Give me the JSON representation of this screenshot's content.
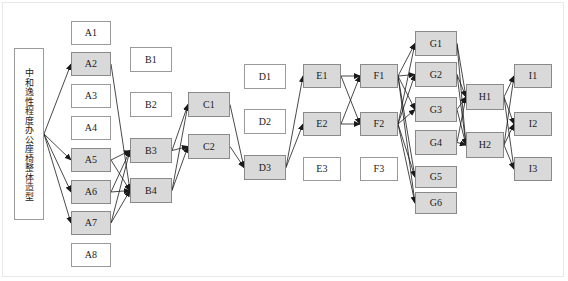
{
  "diagram": {
    "type": "layered-directed-graph",
    "root": {
      "id": "root",
      "label": "中和逸性程度办公座椅整体造型",
      "shaded": false,
      "x": 14,
      "y": 48,
      "w": 30,
      "h": 172
    },
    "colors": {
      "node_fill_plain": "#ffffff",
      "node_fill_shaded": "#d9d9d9",
      "node_stroke": "#9a9a9a",
      "edge_stroke": "#1a1a1a",
      "frame_stroke": "#e8e8e8",
      "text": "#1a1a1a"
    },
    "columns": [
      {
        "name": "A",
        "nodes": [
          {
            "id": "A1",
            "label": "A1",
            "shaded": false,
            "x": 71,
            "y": 21,
            "w": 40,
            "h": 24
          },
          {
            "id": "A2",
            "label": "A2",
            "shaded": true,
            "x": 71,
            "y": 52,
            "w": 40,
            "h": 24
          },
          {
            "id": "A3",
            "label": "A3",
            "shaded": false,
            "x": 71,
            "y": 84,
            "w": 40,
            "h": 24
          },
          {
            "id": "A4",
            "label": "A4",
            "shaded": false,
            "x": 71,
            "y": 116,
            "w": 40,
            "h": 24
          },
          {
            "id": "A5",
            "label": "A5",
            "shaded": true,
            "x": 71,
            "y": 148,
            "w": 40,
            "h": 24
          },
          {
            "id": "A6",
            "label": "A6",
            "shaded": true,
            "x": 71,
            "y": 180,
            "w": 40,
            "h": 24
          },
          {
            "id": "A7",
            "label": "A7",
            "shaded": true,
            "x": 71,
            "y": 211,
            "w": 40,
            "h": 24
          },
          {
            "id": "A8",
            "label": "A8",
            "shaded": false,
            "x": 71,
            "y": 243,
            "w": 40,
            "h": 24
          }
        ]
      },
      {
        "name": "B",
        "nodes": [
          {
            "id": "B1",
            "label": "B1",
            "shaded": false,
            "x": 130,
            "y": 47,
            "w": 42,
            "h": 25
          },
          {
            "id": "B2",
            "label": "B2",
            "shaded": false,
            "x": 130,
            "y": 92,
            "w": 42,
            "h": 25
          },
          {
            "id": "B3",
            "label": "B3",
            "shaded": true,
            "x": 130,
            "y": 138,
            "w": 42,
            "h": 25
          },
          {
            "id": "B4",
            "label": "B4",
            "shaded": true,
            "x": 130,
            "y": 178,
            "w": 42,
            "h": 25
          }
        ]
      },
      {
        "name": "C",
        "nodes": [
          {
            "id": "C1",
            "label": "C1",
            "shaded": true,
            "x": 188,
            "y": 92,
            "w": 42,
            "h": 25
          },
          {
            "id": "C2",
            "label": "C2",
            "shaded": true,
            "x": 188,
            "y": 134,
            "w": 42,
            "h": 25
          }
        ]
      },
      {
        "name": "D",
        "nodes": [
          {
            "id": "D1",
            "label": "D1",
            "shaded": false,
            "x": 244,
            "y": 64,
            "w": 42,
            "h": 25
          },
          {
            "id": "D2",
            "label": "D2",
            "shaded": false,
            "x": 244,
            "y": 109,
            "w": 42,
            "h": 25
          },
          {
            "id": "D3",
            "label": "D3",
            "shaded": true,
            "x": 244,
            "y": 155,
            "w": 42,
            "h": 25
          }
        ]
      },
      {
        "name": "E",
        "nodes": [
          {
            "id": "E1",
            "label": "E1",
            "shaded": true,
            "x": 303,
            "y": 64,
            "w": 38,
            "h": 24
          },
          {
            "id": "E2",
            "label": "E2",
            "shaded": true,
            "x": 303,
            "y": 112,
            "w": 38,
            "h": 24
          },
          {
            "id": "E3",
            "label": "E3",
            "shaded": false,
            "x": 303,
            "y": 157,
            "w": 38,
            "h": 24
          }
        ]
      },
      {
        "name": "F",
        "nodes": [
          {
            "id": "F1",
            "label": "F1",
            "shaded": true,
            "x": 360,
            "y": 64,
            "w": 38,
            "h": 24
          },
          {
            "id": "F2",
            "label": "F2",
            "shaded": true,
            "x": 360,
            "y": 112,
            "w": 38,
            "h": 24
          },
          {
            "id": "F3",
            "label": "F3",
            "shaded": false,
            "x": 360,
            "y": 157,
            "w": 38,
            "h": 24
          }
        ]
      },
      {
        "name": "G",
        "nodes": [
          {
            "id": "G1",
            "label": "G1",
            "shaded": true,
            "x": 415,
            "y": 31,
            "w": 42,
            "h": 25
          },
          {
            "id": "G2",
            "label": "G2",
            "shaded": true,
            "x": 415,
            "y": 62,
            "w": 42,
            "h": 25
          },
          {
            "id": "G3",
            "label": "G3",
            "shaded": true,
            "x": 415,
            "y": 97,
            "w": 42,
            "h": 25
          },
          {
            "id": "G4",
            "label": "G4",
            "shaded": true,
            "x": 415,
            "y": 130,
            "w": 42,
            "h": 25
          },
          {
            "id": "G5",
            "label": "G5",
            "shaded": true,
            "x": 415,
            "y": 166,
            "w": 42,
            "h": 22
          },
          {
            "id": "G6",
            "label": "G6",
            "shaded": true,
            "x": 415,
            "y": 192,
            "w": 42,
            "h": 22
          }
        ]
      },
      {
        "name": "H",
        "nodes": [
          {
            "id": "H1",
            "label": "H1",
            "shaded": true,
            "x": 466,
            "y": 84,
            "w": 38,
            "h": 26
          },
          {
            "id": "H2",
            "label": "H2",
            "shaded": true,
            "x": 466,
            "y": 132,
            "w": 38,
            "h": 26
          }
        ]
      },
      {
        "name": "I",
        "nodes": [
          {
            "id": "I1",
            "label": "I1",
            "shaded": true,
            "x": 514,
            "y": 64,
            "w": 38,
            "h": 24
          },
          {
            "id": "I2",
            "label": "I2",
            "shaded": true,
            "x": 514,
            "y": 112,
            "w": 38,
            "h": 24
          },
          {
            "id": "I3",
            "label": "I3",
            "shaded": true,
            "x": 514,
            "y": 157,
            "w": 38,
            "h": 24
          }
        ]
      }
    ],
    "edges": [
      {
        "from": "root",
        "to": "A2"
      },
      {
        "from": "root",
        "to": "A5"
      },
      {
        "from": "root",
        "to": "A6"
      },
      {
        "from": "root",
        "to": "A7"
      },
      {
        "from": "A2",
        "to": "B4"
      },
      {
        "from": "A5",
        "to": "B3"
      },
      {
        "from": "A5",
        "to": "B4"
      },
      {
        "from": "A6",
        "to": "B3"
      },
      {
        "from": "A6",
        "to": "B4"
      },
      {
        "from": "A7",
        "to": "B3"
      },
      {
        "from": "A7",
        "to": "B4"
      },
      {
        "from": "B3",
        "to": "C1"
      },
      {
        "from": "B3",
        "to": "C2"
      },
      {
        "from": "B4",
        "to": "C1"
      },
      {
        "from": "B4",
        "to": "C2"
      },
      {
        "from": "C1",
        "to": "D3"
      },
      {
        "from": "C2",
        "to": "D3"
      },
      {
        "from": "D3",
        "to": "E1"
      },
      {
        "from": "D3",
        "to": "E2"
      },
      {
        "from": "E1",
        "to": "F1"
      },
      {
        "from": "E1",
        "to": "F2"
      },
      {
        "from": "E2",
        "to": "F1"
      },
      {
        "from": "E2",
        "to": "F2"
      },
      {
        "from": "F1",
        "to": "G1"
      },
      {
        "from": "F1",
        "to": "G2"
      },
      {
        "from": "F1",
        "to": "G3"
      },
      {
        "from": "F1",
        "to": "G5"
      },
      {
        "from": "F1",
        "to": "G6"
      },
      {
        "from": "F2",
        "to": "G1"
      },
      {
        "from": "F2",
        "to": "G2"
      },
      {
        "from": "F2",
        "to": "G3"
      },
      {
        "from": "F2",
        "to": "G5"
      },
      {
        "from": "F2",
        "to": "G6"
      },
      {
        "from": "G1",
        "to": "H1"
      },
      {
        "from": "G1",
        "to": "H2"
      },
      {
        "from": "G2",
        "to": "H1"
      },
      {
        "from": "G2",
        "to": "H2"
      },
      {
        "from": "G3",
        "to": "H1"
      },
      {
        "from": "G3",
        "to": "H2"
      },
      {
        "from": "G4",
        "to": "H1"
      },
      {
        "from": "G4",
        "to": "H2"
      },
      {
        "from": "H1",
        "to": "I1"
      },
      {
        "from": "H1",
        "to": "I2"
      },
      {
        "from": "H1",
        "to": "I3"
      },
      {
        "from": "H2",
        "to": "I1"
      },
      {
        "from": "H2",
        "to": "I2"
      },
      {
        "from": "H2",
        "to": "I3"
      }
    ]
  }
}
